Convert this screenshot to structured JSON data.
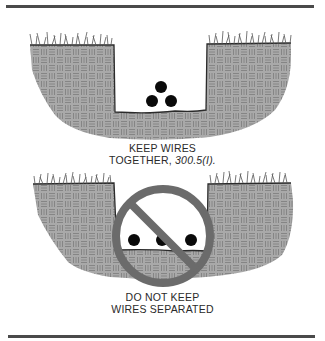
{
  "figure": {
    "colors": {
      "rule": "#4a4a4a",
      "soil_fill": "#a9a9a9",
      "soil_pattern": "#7c7c7c",
      "soil_outline": "#2b2b2b",
      "grass": "#555555",
      "wire": "#0a0a0a",
      "prohibition": "#6b6b6b",
      "text": "#2a2a2a"
    },
    "panels": [
      {
        "id": "correct",
        "caption_line1": "KEEP WIRES",
        "caption_line2_prefix": "TOGETHER,",
        "caption_line2_ref": "300.5(I).",
        "wire_count": 3,
        "wire_arrangement": "grouped-triangle"
      },
      {
        "id": "incorrect",
        "caption_line1": "DO NOT KEEP",
        "caption_line2": "WIRES SEPARATED",
        "wire_count": 3,
        "wire_arrangement": "spaced-row",
        "overlay_icon": "prohibition-sign"
      }
    ]
  }
}
